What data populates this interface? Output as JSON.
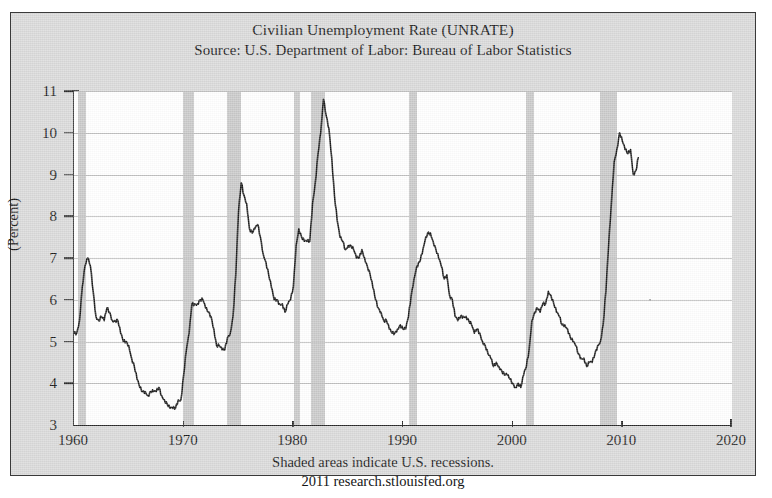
{
  "chart": {
    "title": "Civilian Unemployment Rate (UNRATE)",
    "subtitle": "Source: U.S. Department of Labor: Bureau of Labor Statistics",
    "footer_line1": "Shaded areas indicate U.S. recessions.",
    "footer_line2": "2011 research.stlouisfed.org",
    "axis_title": "(Percent)"
  },
  "chart_data": {
    "type": "line",
    "title": "Civilian Unemployment Rate (UNRATE)",
    "subtitle": "Source: U.S. Department of Labor: Bureau of Labor Statistics",
    "xlabel": "",
    "ylabel": "(Percent)",
    "xlim": [
      1960,
      2020
    ],
    "ylim": [
      3,
      11
    ],
    "xticks": [
      1960,
      1970,
      1980,
      1990,
      2000,
      2010,
      2020
    ],
    "ytick_labels": [
      "3",
      "4",
      "5",
      "6",
      "7",
      "8",
      "9",
      "10",
      "11"
    ],
    "yticks": [
      3,
      4,
      5,
      6,
      7,
      8,
      9,
      10,
      11
    ],
    "grid": "horizontal",
    "legend": "none",
    "line_color": "#1a1a1a",
    "recession_band_color": "#c9c9c9",
    "plot_background": "#ffffff",
    "figure_background": "#d9d9d9",
    "annotations": [
      "Shaded areas indicate U.S. recessions.",
      "2011 research.stlouisfed.org"
    ],
    "series": [
      {
        "name": "Civilian Unemployment Rate",
        "x": [
          1960.0,
          1960.25,
          1960.5,
          1960.75,
          1961.0,
          1961.25,
          1961.5,
          1961.75,
          1962.0,
          1962.25,
          1962.5,
          1962.75,
          1963.0,
          1963.25,
          1963.5,
          1963.75,
          1964.0,
          1964.25,
          1964.5,
          1964.75,
          1965.0,
          1965.25,
          1965.5,
          1965.75,
          1966.0,
          1966.25,
          1966.5,
          1966.75,
          1967.0,
          1967.25,
          1967.5,
          1967.75,
          1968.0,
          1968.25,
          1968.5,
          1968.75,
          1969.0,
          1969.25,
          1969.5,
          1969.75,
          1970.0,
          1970.25,
          1970.5,
          1970.75,
          1971.0,
          1971.25,
          1971.5,
          1971.75,
          1972.0,
          1972.25,
          1972.5,
          1972.75,
          1973.0,
          1973.25,
          1973.5,
          1973.75,
          1974.0,
          1974.25,
          1974.5,
          1974.75,
          1975.0,
          1975.25,
          1975.5,
          1975.75,
          1976.0,
          1976.25,
          1976.5,
          1976.75,
          1977.0,
          1977.25,
          1977.5,
          1977.75,
          1978.0,
          1978.25,
          1978.5,
          1978.75,
          1979.0,
          1979.25,
          1979.5,
          1979.75,
          1980.0,
          1980.25,
          1980.5,
          1980.75,
          1981.0,
          1981.25,
          1981.5,
          1981.75,
          1982.0,
          1982.25,
          1982.5,
          1982.75,
          1983.0,
          1983.25,
          1983.5,
          1983.75,
          1984.0,
          1984.25,
          1984.5,
          1984.75,
          1985.0,
          1985.25,
          1985.5,
          1985.75,
          1986.0,
          1986.25,
          1986.5,
          1986.75,
          1987.0,
          1987.25,
          1987.5,
          1987.75,
          1988.0,
          1988.25,
          1988.5,
          1988.75,
          1989.0,
          1989.25,
          1989.5,
          1989.75,
          1990.0,
          1990.25,
          1990.5,
          1990.75,
          1991.0,
          1991.25,
          1991.5,
          1991.75,
          1992.0,
          1992.25,
          1992.5,
          1992.75,
          1993.0,
          1993.25,
          1993.5,
          1993.75,
          1994.0,
          1994.25,
          1994.5,
          1994.75,
          1995.0,
          1995.25,
          1995.5,
          1995.75,
          1996.0,
          1996.25,
          1996.5,
          1996.75,
          1997.0,
          1997.25,
          1997.5,
          1997.75,
          1998.0,
          1998.25,
          1998.5,
          1998.75,
          1999.0,
          1999.25,
          1999.5,
          1999.75,
          2000.0,
          2000.25,
          2000.5,
          2000.75,
          2001.0,
          2001.25,
          2001.5,
          2001.75,
          2002.0,
          2002.25,
          2002.5,
          2002.75,
          2003.0,
          2003.25,
          2003.5,
          2003.75,
          2004.0,
          2004.25,
          2004.5,
          2004.75,
          2005.0,
          2005.25,
          2005.5,
          2005.75,
          2006.0,
          2006.25,
          2006.5,
          2006.75,
          2007.0,
          2007.25,
          2007.5,
          2007.75,
          2008.0,
          2008.25,
          2008.5,
          2008.75,
          2009.0,
          2009.25,
          2009.5,
          2009.75,
          2010.0,
          2010.25,
          2010.5,
          2010.75,
          2011.0,
          2011.25,
          2011.45
        ],
        "values": [
          5.2,
          5.2,
          5.5,
          6.3,
          6.8,
          7.0,
          6.8,
          6.2,
          5.6,
          5.5,
          5.6,
          5.5,
          5.8,
          5.7,
          5.5,
          5.5,
          5.5,
          5.2,
          5.0,
          5.0,
          4.9,
          4.6,
          4.4,
          4.1,
          3.9,
          3.8,
          3.8,
          3.7,
          3.8,
          3.8,
          3.8,
          3.9,
          3.7,
          3.6,
          3.5,
          3.4,
          3.4,
          3.4,
          3.6,
          3.6,
          4.2,
          4.8,
          5.2,
          5.9,
          5.9,
          5.9,
          6.0,
          6.0,
          5.8,
          5.7,
          5.6,
          5.3,
          4.9,
          4.9,
          4.8,
          4.8,
          5.1,
          5.2,
          5.6,
          6.6,
          8.1,
          8.8,
          8.5,
          8.3,
          7.7,
          7.6,
          7.7,
          7.8,
          7.5,
          7.1,
          6.9,
          6.6,
          6.3,
          6.0,
          6.0,
          5.9,
          5.9,
          5.7,
          5.9,
          6.0,
          6.3,
          7.3,
          7.7,
          7.5,
          7.4,
          7.4,
          7.4,
          8.3,
          8.8,
          9.5,
          10.0,
          10.8,
          10.4,
          10.1,
          9.4,
          8.5,
          7.9,
          7.5,
          7.4,
          7.2,
          7.3,
          7.3,
          7.2,
          7.0,
          7.0,
          7.2,
          7.0,
          6.8,
          6.6,
          6.3,
          6.0,
          5.8,
          5.7,
          5.5,
          5.5,
          5.3,
          5.2,
          5.2,
          5.3,
          5.4,
          5.3,
          5.3,
          5.6,
          6.1,
          6.5,
          6.8,
          6.9,
          7.1,
          7.4,
          7.6,
          7.6,
          7.4,
          7.2,
          7.0,
          6.8,
          6.5,
          6.6,
          6.1,
          6.0,
          5.6,
          5.5,
          5.6,
          5.6,
          5.6,
          5.5,
          5.4,
          5.2,
          5.3,
          5.2,
          5.0,
          4.9,
          4.7,
          4.6,
          4.4,
          4.5,
          4.4,
          4.3,
          4.2,
          4.2,
          4.1,
          4.0,
          3.9,
          4.0,
          3.9,
          4.2,
          4.4,
          4.8,
          5.5,
          5.7,
          5.8,
          5.7,
          5.9,
          5.9,
          6.2,
          6.1,
          5.9,
          5.7,
          5.6,
          5.4,
          5.4,
          5.3,
          5.1,
          5.0,
          4.9,
          4.7,
          4.6,
          4.6,
          4.4,
          4.5,
          4.5,
          4.7,
          4.9,
          5.0,
          5.4,
          6.2,
          7.3,
          8.3,
          9.3,
          9.6,
          10.0,
          9.8,
          9.6,
          9.5,
          9.6,
          9.0,
          9.1,
          9.4
        ]
      }
    ],
    "recessions": [
      {
        "label": "1960-61",
        "start": 1960.33,
        "end": 1961.08
      },
      {
        "label": "1969-70",
        "start": 1969.92,
        "end": 1970.92
      },
      {
        "label": "1973-75",
        "start": 1973.92,
        "end": 1975.25
      },
      {
        "label": "1980",
        "start": 1980.08,
        "end": 1980.58
      },
      {
        "label": "1981-82",
        "start": 1981.58,
        "end": 1982.92
      },
      {
        "label": "1990-91",
        "start": 1990.58,
        "end": 1991.25
      },
      {
        "label": "2001",
        "start": 2001.25,
        "end": 2001.92
      },
      {
        "label": "2007-09",
        "start": 2007.92,
        "end": 2009.5
      }
    ]
  }
}
